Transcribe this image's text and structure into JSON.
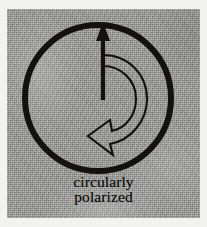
{
  "figure": {
    "name": "circularly-polarized-symbol",
    "caption_line_1": "circularly",
    "caption_line_2": "polarized",
    "background_color": "#9c9c9a",
    "ink_color": "#141210",
    "page_color": "#f2f2ef"
  },
  "diagram_elements": {
    "outer_circle": {
      "label": "outer circle",
      "center_x": 98,
      "center_y": 98,
      "radius": 73,
      "stroke_width": 6,
      "color": "#141210"
    },
    "straight_arrow": {
      "label": "vertical polarization arrow",
      "direction": "up",
      "tip_x": 103,
      "tip_y": 25,
      "tail_x": 103,
      "tail_y": 100,
      "style": "solid",
      "color": "#141210"
    },
    "curved_arrow": {
      "label": "counterclockwise rotation arrow",
      "direction": "counterclockwise",
      "style": "outlined",
      "head_points_to": "lower-left",
      "stroke_width": 2,
      "color": "#141210"
    }
  }
}
